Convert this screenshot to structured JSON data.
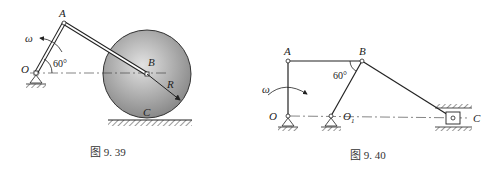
{
  "figures": [
    {
      "id": "fig-9-39",
      "caption": "图 9. 39",
      "labels": {
        "A": "A",
        "B": "B",
        "O": "O",
        "C": "C",
        "R": "R",
        "omega": "ω",
        "angle": "60°"
      },
      "elements": [
        "crank OA",
        "connecting rod AB",
        "disk of radius R centered at B",
        "ground contact C"
      ]
    },
    {
      "id": "fig-9-40",
      "caption": "图 9. 40",
      "labels": {
        "A": "A",
        "B": "B",
        "O": "O",
        "O1": "O",
        "O1_sub": "1",
        "C": "C",
        "omega": "ω",
        "angle": "60°"
      },
      "elements": [
        "crank OA",
        "link AB",
        "rocker O1B",
        "rod BC",
        "slider C in guide"
      ]
    }
  ],
  "colors": {
    "line": "#222222",
    "disk_light": "#d8d8d8",
    "disk_dark": "#8a8a8a",
    "caption": "#333333"
  }
}
